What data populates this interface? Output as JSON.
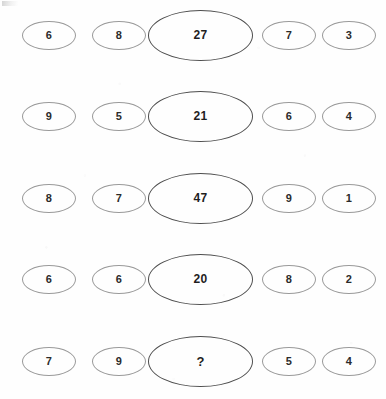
{
  "puzzle": {
    "kind": "number-sequence-ellipses",
    "columns": 5,
    "rows": [
      {
        "cells": [
          {
            "value": "6",
            "size": "small"
          },
          {
            "value": "8",
            "size": "small"
          },
          {
            "value": "27",
            "size": "large"
          },
          {
            "value": "7",
            "size": "small"
          },
          {
            "value": "3",
            "size": "small"
          }
        ]
      },
      {
        "cells": [
          {
            "value": "9",
            "size": "small"
          },
          {
            "value": "5",
            "size": "small"
          },
          {
            "value": "21",
            "size": "large"
          },
          {
            "value": "6",
            "size": "small"
          },
          {
            "value": "4",
            "size": "small"
          }
        ]
      },
      {
        "cells": [
          {
            "value": "8",
            "size": "small"
          },
          {
            "value": "7",
            "size": "small"
          },
          {
            "value": "47",
            "size": "large"
          },
          {
            "value": "9",
            "size": "small"
          },
          {
            "value": "1",
            "size": "small"
          }
        ]
      },
      {
        "cells": [
          {
            "value": "6",
            "size": "small"
          },
          {
            "value": "6",
            "size": "small"
          },
          {
            "value": "20",
            "size": "large"
          },
          {
            "value": "8",
            "size": "small"
          },
          {
            "value": "2",
            "size": "small"
          }
        ]
      },
      {
        "cells": [
          {
            "value": "7",
            "size": "small"
          },
          {
            "value": "9",
            "size": "small"
          },
          {
            "value": "?",
            "size": "large",
            "unknown": true
          },
          {
            "value": "5",
            "size": "small"
          },
          {
            "value": "4",
            "size": "small"
          }
        ]
      }
    ],
    "row_centers_y": [
      34,
      115,
      197,
      278,
      360
    ],
    "colors": {
      "page_background": "#fefefe",
      "small_ellipse_stroke": "#9a9a9a",
      "large_ellipse_stroke": "#4d4d4d",
      "digit_color": "#2b2b2b"
    }
  }
}
